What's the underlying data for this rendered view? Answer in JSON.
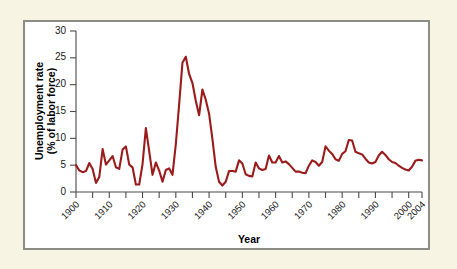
{
  "figure": {
    "background_color": "#f7f4e3",
    "plot_background_color": "#ffffff",
    "frame_color": "#8d8d85"
  },
  "chart_data": {
    "type": "line",
    "title": "",
    "subtitle": "",
    "xlabel": "Year",
    "ylabel": "Unemployment rate\n(% of labor force)",
    "ylabel_line1": "Unemployment rate",
    "ylabel_line2": "(% of labor force)",
    "xlim": [
      1900,
      2004
    ],
    "ylim": [
      0,
      30
    ],
    "grid": false,
    "legend": false,
    "line_color": "#9b1b1b",
    "y_ticks": [
      0,
      5,
      10,
      15,
      20,
      25,
      30
    ],
    "y_tick_labels": [
      "0",
      "5",
      "10",
      "15",
      "20",
      "25",
      "30"
    ],
    "x_major_ticks": [
      1900,
      1910,
      1920,
      1930,
      1940,
      1950,
      1960,
      1970,
      1980,
      1990,
      2000,
      2004
    ],
    "x_tick_labels": [
      "1900",
      "1910",
      "1920",
      "1930",
      "1940",
      "1950",
      "1960",
      "1970",
      "1980",
      "1990",
      "2000",
      "2004"
    ],
    "x_minor_tick_interval": 5,
    "series": [
      {
        "name": "Unemployment rate",
        "color": "#9b1b1b",
        "x": [
          1900,
          1901,
          1902,
          1903,
          1904,
          1905,
          1906,
          1907,
          1908,
          1909,
          1910,
          1911,
          1912,
          1913,
          1914,
          1915,
          1916,
          1917,
          1918,
          1919,
          1920,
          1921,
          1922,
          1923,
          1924,
          1925,
          1926,
          1927,
          1928,
          1929,
          1930,
          1931,
          1932,
          1933,
          1934,
          1935,
          1936,
          1937,
          1938,
          1939,
          1940,
          1941,
          1942,
          1943,
          1944,
          1945,
          1946,
          1947,
          1948,
          1949,
          1950,
          1951,
          1952,
          1953,
          1954,
          1955,
          1956,
          1957,
          1958,
          1959,
          1960,
          1961,
          1962,
          1963,
          1964,
          1965,
          1966,
          1967,
          1968,
          1969,
          1970,
          1971,
          1972,
          1973,
          1974,
          1975,
          1976,
          1977,
          1978,
          1979,
          1980,
          1981,
          1982,
          1983,
          1984,
          1985,
          1986,
          1987,
          1988,
          1989,
          1990,
          1991,
          1992,
          1993,
          1994,
          1995,
          1996,
          1997,
          1998,
          1999,
          2000,
          2001,
          2002,
          2003,
          2004
        ],
        "values": [
          5.0,
          4.0,
          3.7,
          3.9,
          5.4,
          4.3,
          1.7,
          2.8,
          8.0,
          5.1,
          5.9,
          6.7,
          4.6,
          4.3,
          7.9,
          8.5,
          5.1,
          4.6,
          1.4,
          1.4,
          5.2,
          11.9,
          7.6,
          3.2,
          5.5,
          4.0,
          1.9,
          4.1,
          4.4,
          3.2,
          8.9,
          16.3,
          24.1,
          25.2,
          22.0,
          20.3,
          17.0,
          14.3,
          19.1,
          17.2,
          14.6,
          9.9,
          4.7,
          1.9,
          1.2,
          1.9,
          3.9,
          3.9,
          3.8,
          5.9,
          5.3,
          3.3,
          3.0,
          2.9,
          5.5,
          4.4,
          4.1,
          4.3,
          6.8,
          5.5,
          5.5,
          6.7,
          5.5,
          5.7,
          5.2,
          4.5,
          3.8,
          3.8,
          3.6,
          3.5,
          4.9,
          5.9,
          5.6,
          4.9,
          5.6,
          8.5,
          7.7,
          7.1,
          6.1,
          5.8,
          7.1,
          7.6,
          9.7,
          9.6,
          7.5,
          7.2,
          7.0,
          6.2,
          5.5,
          5.3,
          5.6,
          6.8,
          7.5,
          6.9,
          6.1,
          5.6,
          5.4,
          4.9,
          4.5,
          4.2,
          4.0,
          4.7,
          5.8,
          6.0,
          5.9
        ]
      }
    ]
  }
}
